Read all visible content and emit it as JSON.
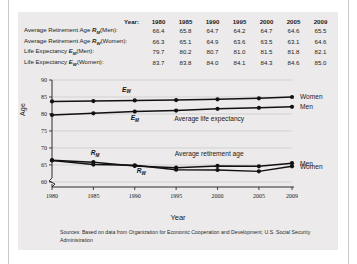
{
  "figure": {
    "source_note": "Sources: Based on data from Organization for Economic Cooperation and Development; U.S. Social Security Administration"
  },
  "table": {
    "header_label": "Year:",
    "years": [
      "1980",
      "1985",
      "1990",
      "1995",
      "2000",
      "2005",
      "2009"
    ],
    "rows": [
      {
        "label_prefix": "Average Retirement Age ",
        "symbol": "R",
        "subscript": "M",
        "label_suffix": "(Men):",
        "values": [
          "66.4",
          "65.8",
          "64.7",
          "64.2",
          "64.7",
          "64.6",
          "65.5"
        ]
      },
      {
        "label_prefix": "Average Retirement Age ",
        "symbol": "R",
        "subscript": "W",
        "label_suffix": "(Women):",
        "values": [
          "66.3",
          "65.1",
          "64.9",
          "63.6",
          "63.5",
          "63.1",
          "64.6"
        ]
      },
      {
        "label_prefix": "Life Expectancy ",
        "symbol": "E",
        "subscript": "M",
        "label_suffix": "(Men):",
        "values": [
          "79.7",
          "80.2",
          "80.7",
          "81.0",
          "81.5",
          "81.8",
          "82.1"
        ]
      },
      {
        "label_prefix": "Life Expectancy ",
        "symbol": "E",
        "subscript": "W",
        "label_suffix": "(Women):",
        "values": [
          "83.7",
          "83.8",
          "84.0",
          "84.1",
          "84.3",
          "84.6",
          "85.0"
        ]
      }
    ]
  },
  "chart_data": {
    "type": "line",
    "title": "",
    "xlabel": "Year",
    "ylabel": "Age",
    "x": [
      1980,
      1985,
      1990,
      1995,
      2000,
      2005,
      2009
    ],
    "xtick_labels": [
      "1980",
      "1985",
      "1990",
      "1995",
      "2000",
      "2005",
      "2009"
    ],
    "ytick_labels": [
      "60",
      "65",
      "70",
      "75",
      "80",
      "85",
      "90"
    ],
    "yticks": [
      60,
      65,
      70,
      75,
      80,
      85,
      90
    ],
    "ylim": [
      58.5,
      90
    ],
    "axis_break": true,
    "grid": true,
    "legend_position": "right-of-axes",
    "series": [
      {
        "name": "Life Expectancy (Women)",
        "symbol": "E",
        "subscript": "W",
        "side_label": "Women",
        "values": [
          83.7,
          83.8,
          84.0,
          84.1,
          84.3,
          84.6,
          85.0
        ]
      },
      {
        "name": "Life Expectancy (Men)",
        "symbol": "E",
        "subscript": "M",
        "side_label": "Men",
        "values": [
          79.7,
          80.2,
          80.7,
          81.0,
          81.5,
          81.8,
          82.1
        ]
      },
      {
        "name": "Average Retirement Age (Men)",
        "symbol": "R",
        "subscript": "M",
        "side_label": "Men",
        "values": [
          66.4,
          65.8,
          64.7,
          64.2,
          64.7,
          64.6,
          65.5
        ]
      },
      {
        "name": "Average Retirement Age (Women)",
        "symbol": "R",
        "subscript": "W",
        "side_label": "Women",
        "values": [
          66.3,
          65.1,
          64.9,
          63.6,
          63.5,
          63.1,
          64.6
        ]
      }
    ],
    "annotations": [
      {
        "text": "Average life expectancy",
        "x": 1999.0,
        "y": 77.8
      },
      {
        "text": "Average retirement age",
        "x": 1999.0,
        "y": 67.6
      }
    ]
  }
}
